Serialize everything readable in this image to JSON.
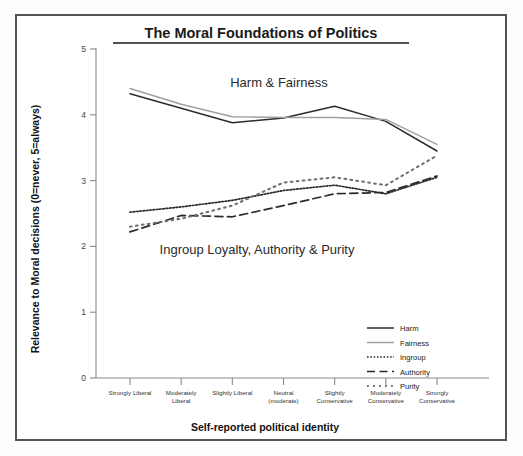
{
  "figure": {
    "title": "The Moral Foundations of Politics",
    "annotations": [
      {
        "id": "upper-group-annotation",
        "text": "Harm & Fairness"
      },
      {
        "id": "lower-group-annotation",
        "text": "Ingroup Loyalty, Authority & Purity"
      }
    ]
  },
  "chart_data": {
    "type": "line",
    "title": "The Moral Foundations of Politics",
    "xlabel": "Self-reported political identity",
    "ylabel": "Relevance to Moral decisions (0=never, 5=always)",
    "ylim": [
      0,
      5
    ],
    "yticks": [
      0,
      1,
      2,
      3,
      4,
      5
    ],
    "grid": false,
    "legend_position": "bottom-right",
    "categories": [
      "Strongly Liberal",
      "Moderately Liberal",
      "Slightly Liberal",
      "Neutral (moderate)",
      "Slightly Conservative",
      "Moderately Conservative",
      "Strongly Conservative"
    ],
    "series": [
      {
        "name": "Harm",
        "style": "solid",
        "color": "#2b2b2b",
        "values": [
          4.32,
          4.1,
          3.88,
          3.95,
          4.13,
          3.9,
          3.45
        ]
      },
      {
        "name": "Fairness",
        "style": "solid",
        "color": "#a0a0a0",
        "values": [
          4.4,
          4.16,
          3.97,
          3.96,
          3.96,
          3.93,
          3.55
        ]
      },
      {
        "name": "Ingroup",
        "style": "dotted-fine",
        "color": "#2b2b2b",
        "values": [
          2.52,
          2.6,
          2.7,
          2.85,
          2.93,
          2.8,
          3.05
        ]
      },
      {
        "name": "Authority",
        "style": "dashed",
        "color": "#2b2b2b",
        "values": [
          2.22,
          2.47,
          2.45,
          2.62,
          2.8,
          2.82,
          3.07
        ]
      },
      {
        "name": "Purity",
        "style": "dotted-wide",
        "color": "#6e6e6e",
        "values": [
          2.3,
          2.42,
          2.62,
          2.97,
          3.05,
          2.93,
          3.38
        ]
      }
    ]
  },
  "legend": {
    "items": [
      {
        "label": "Harm"
      },
      {
        "label": "Fairness"
      },
      {
        "label": "Ingroup"
      },
      {
        "label": "Authority"
      },
      {
        "label": "Purity"
      }
    ]
  },
  "axes": {
    "y_ticks": [
      "0",
      "1",
      "2",
      "3",
      "4",
      "5"
    ],
    "x_tick_lines": [
      [
        "Strongly Liberal",
        ""
      ],
      [
        "Moderately",
        "Liberal"
      ],
      [
        "Slightly Liberal",
        ""
      ],
      [
        "Neutral",
        "(moderate)"
      ],
      [
        "Slightly",
        "Conservative"
      ],
      [
        "Moderately",
        "Conservative"
      ],
      [
        "Strongly",
        "Conservative"
      ]
    ]
  }
}
